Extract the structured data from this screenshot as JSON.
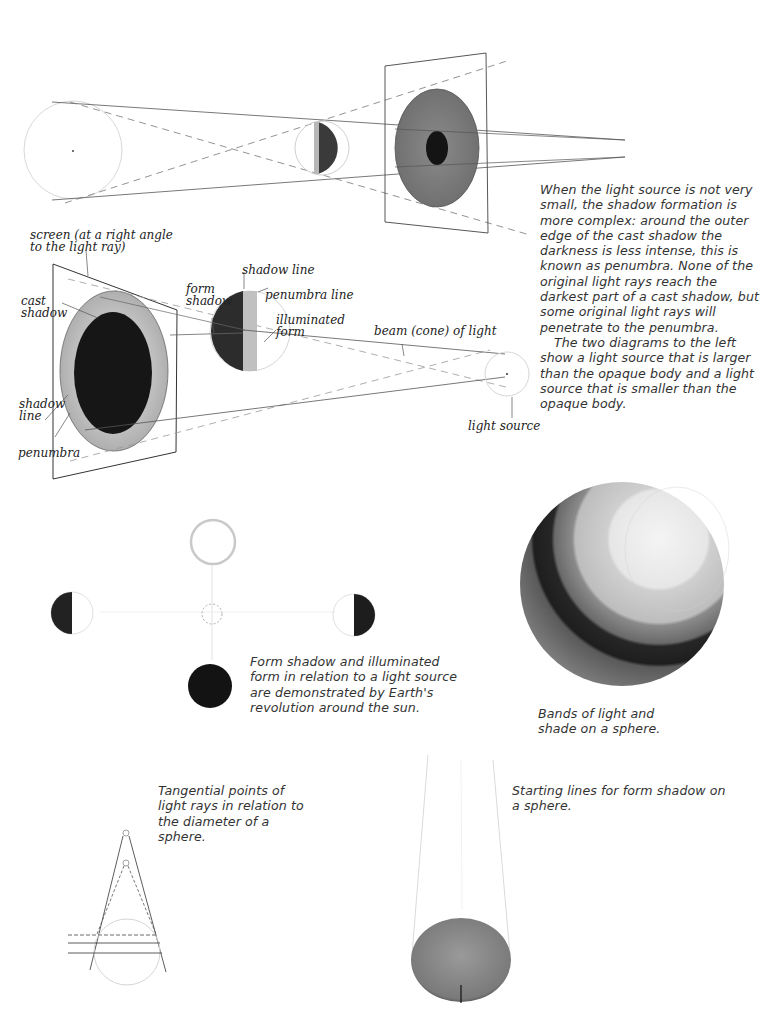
{
  "page": {
    "background": "#ffffff"
  },
  "figure1": {
    "description": "Light source smaller than opaque body: shadow cast on screen with penumbra"
  },
  "paragraph": {
    "p1": "When the light source is not very small, the shadow formation is more complex: around the outer edge of the cast shadow the darkness is less intense, this is known as penumbra. None of the original light rays reach the darkest part of a cast shadow, but some original light rays will penetrate to the penumbra.",
    "p2": "The two diagrams to the left show a light source that is larger than the opaque body and a light source that is smaller than the opaque body."
  },
  "figure2": {
    "labels": {
      "screen": "screen (at a right angle",
      "screen2": "to the light ray)",
      "cast_shadow1": "cast",
      "cast_shadow2": "shadow",
      "form_shadow1": "form",
      "form_shadow2": "shadow",
      "shadow_line_top": "shadow line",
      "penumbra_line": "penumbra line",
      "illuminated1": "illuminated",
      "illuminated2": "form",
      "beam": "beam (cone) of light",
      "shadow_line_left1": "shadow",
      "shadow_line_left2": "line",
      "penumbra": "penumbra",
      "light_source": "light source"
    }
  },
  "figure3": {
    "caption": "Form shadow and illuminated form in relation to a light source are demonstrated by Earth's revolution around the sun."
  },
  "figure4": {
    "caption": "Bands of light and shade on a sphere."
  },
  "figure5": {
    "caption": "Tangential points of light rays in relation to the diameter of a sphere."
  },
  "figure6": {
    "caption": "Starting lines for form shadow on a sphere."
  },
  "colors": {
    "ink": "#2a2a2a",
    "graphite_dark": "#1a1a1a",
    "graphite_mid": "#7a7a7a",
    "graphite_light": "#bdbdbd"
  }
}
